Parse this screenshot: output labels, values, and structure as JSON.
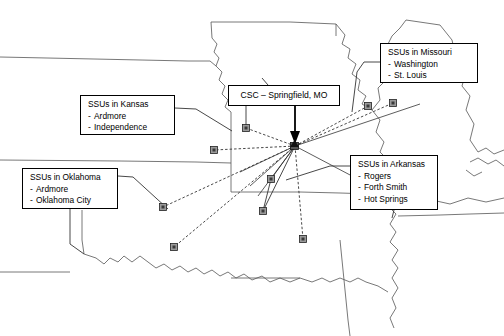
{
  "diagram": {
    "type": "hub-and-spoke network map",
    "hub": {
      "label": "CSC – Springfield, MO",
      "short_name": "CSC",
      "city": "Springfield",
      "state": "MO",
      "x": 295,
      "y": 146
    },
    "callouts": [
      {
        "id": "csc",
        "title": "CSC – Springfield, MO",
        "items": []
      },
      {
        "id": "kansas",
        "title": "SSUs in Kansas",
        "items": [
          "Ardmore",
          "Independence"
        ]
      },
      {
        "id": "oklahoma",
        "title": "SSUs in Oklahoma",
        "items": [
          "Ardmore",
          "Oklahoma City"
        ]
      },
      {
        "id": "missouri",
        "title": "SSUs in Missouri",
        "items": [
          "Washington",
          "St. Louis"
        ]
      },
      {
        "id": "arkansas",
        "title": "SSUs in Arkansas",
        "items": [
          "Rogers",
          "Forth Smith",
          "Hot Springs"
        ]
      }
    ],
    "bullet": "-",
    "nodes": [
      {
        "name": "ssu-node-kansas-independence",
        "x": 246,
        "y": 128
      },
      {
        "name": "ssu-node-kansas-ardmore",
        "x": 214,
        "y": 150
      },
      {
        "name": "ssu-node-missouri-washington",
        "x": 368,
        "y": 106
      },
      {
        "name": "ssu-node-missouri-st-louis",
        "x": 393,
        "y": 103
      },
      {
        "name": "ssu-node-arkansas-rogers",
        "x": 271,
        "y": 179
      },
      {
        "name": "ssu-node-arkansas-forth-smith",
        "x": 263,
        "y": 211
      },
      {
        "name": "ssu-node-arkansas-hot-springs",
        "x": 303,
        "y": 239
      },
      {
        "name": "ssu-node-oklahoma-oklahoma-city",
        "x": 163,
        "y": 207
      },
      {
        "name": "ssu-node-oklahoma-ardmore",
        "x": 174,
        "y": 247
      }
    ],
    "colors": {
      "line": "#3a3a3a",
      "border": "#000000",
      "node_fill": "#9a9a9a",
      "background": "#ffffff",
      "text": "#000000"
    }
  }
}
